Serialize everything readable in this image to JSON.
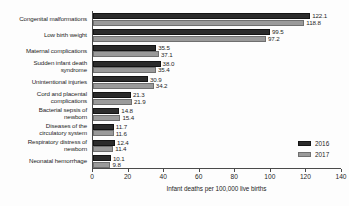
{
  "chart_data": {
    "type": "bar",
    "orientation": "horizontal",
    "title": "",
    "xlabel": "Infant deaths per 100,000 live births",
    "ylabel": "",
    "xlim": [
      0,
      140
    ],
    "xticks": [
      0,
      20,
      40,
      60,
      80,
      100,
      120,
      140
    ],
    "grid": false,
    "legend_position": "right-inside-lower",
    "categories": [
      "Congenital malformations",
      "Low birth weight",
      "Maternal complications",
      "Sudden infant death syndrome",
      "Unintentional injuries",
      "Cord and placental complications",
      "Bacterial sepsis of newborn",
      "Diseases of the circulatory system",
      "Respiratory distress of newborn",
      "Neonatal hemorrhage"
    ],
    "category_lines": [
      [
        "Congenital malformations"
      ],
      [
        "Low birth weight"
      ],
      [
        "Maternal complications"
      ],
      [
        "Sudden infant death",
        "syndrome"
      ],
      [
        "Unintentional injuries"
      ],
      [
        "Cord and placental",
        "complications"
      ],
      [
        "Bacterial sepsis of",
        "newborn"
      ],
      [
        "Diseases of the",
        "circulatory system"
      ],
      [
        "Respiratory distress of",
        "newborn"
      ],
      [
        "Neonatal hemorrhage"
      ]
    ],
    "series": [
      {
        "name": "2016",
        "color": "#2b2b2b",
        "values": [
          122.1,
          99.5,
          35.5,
          38.0,
          30.9,
          21.3,
          14.8,
          11.7,
          12.4,
          10.1
        ]
      },
      {
        "name": "2017",
        "color": "#9a9a9a",
        "values": [
          118.8,
          97.2,
          37.1,
          35.4,
          34.2,
          21.9,
          15.4,
          11.6,
          11.4,
          9.8
        ]
      }
    ],
    "value_labels": {
      "2016": [
        "122.1",
        "99.5",
        "35.5",
        "38.0",
        "30.9",
        "21.3",
        "14.8",
        "11.7",
        "12.4",
        "10.1"
      ],
      "2017": [
        "118.8",
        "97.2",
        "37.1",
        "35.4",
        "34.2",
        "21.9",
        "15.4",
        "11.6",
        "11.4",
        "9.8"
      ]
    }
  },
  "legend": {
    "items": [
      {
        "label": "2016"
      },
      {
        "label": "2017"
      }
    ]
  }
}
